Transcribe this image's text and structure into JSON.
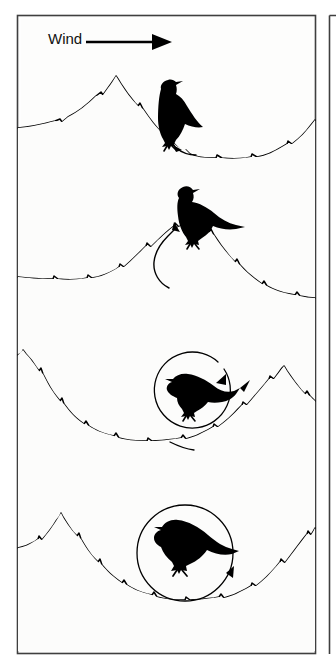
{
  "figure": {
    "name": "snow-dune-bird-sequence",
    "panel_count": 4,
    "background_color": "#fdfdfc",
    "ink_color": "#000000",
    "frame": {
      "outer_border_color": "#3b3b3b",
      "inner_border_color": "#555555",
      "x": 17,
      "y": 15,
      "width": 299,
      "height": 639
    },
    "side_frame": {
      "visible": true,
      "x": 328,
      "y": 15,
      "width": 8,
      "height": 639
    }
  },
  "annotations": {
    "wind_label": "Wind",
    "wind_arrow_direction": "right",
    "wind_arrow": {
      "x1": 86,
      "y1": 42,
      "x2": 168,
      "y2": 42
    }
  },
  "panels": [
    {
      "id": "panel-1",
      "index": 1,
      "caption": "",
      "bird": {
        "x": 175,
        "y": 115,
        "facing": "right",
        "pose": "standing-upright"
      },
      "flow_marker": {
        "type": "short-arrow",
        "direction": "up-left",
        "description": "small arrow at bird feet pointing back toward the slope"
      },
      "terrain": {
        "description": "sharp dune crest left of bird, bird on lee slope, broad trough to the right",
        "crest_x": 115,
        "trough_x": 240
      }
    },
    {
      "id": "panel-2",
      "index": 2,
      "caption": "",
      "bird": {
        "x": 192,
        "y": 212,
        "facing": "right",
        "pose": "standing-on-crest"
      },
      "flow_marker": {
        "type": "j-curve-arrow",
        "direction": "up",
        "description": "curved arrow sweeping up the lee face toward the bird"
      },
      "terrain": {
        "description": "rounded dune crest under the bird, long trough to the left",
        "crest_x": 192,
        "trough_x": 80
      }
    },
    {
      "id": "panel-3",
      "index": 3,
      "caption": "",
      "bird": {
        "x": 205,
        "y": 392,
        "facing": "left",
        "pose": "crouched-head-down"
      },
      "flow_marker": {
        "type": "circular-vortex-arrow",
        "direction": "clockwise",
        "description": "near-complete circular eddy arrow ending above and right of the bird"
      },
      "terrain": {
        "description": "wide trough between dunes, steep slope rising at the right edge",
        "trough_x": 150,
        "crest_x": 283
      }
    },
    {
      "id": "panel-4",
      "index": 4,
      "caption": "",
      "bird": {
        "x": 185,
        "y": 548,
        "facing": "left",
        "pose": "standing-in-hollow"
      },
      "flow_marker": {
        "type": "circular-vortex-arrow",
        "direction": "clockwise",
        "description": "full circular eddy arrow enclosing the bird, arrowhead at lower right"
      },
      "terrain": {
        "description": "sharp dune peak at left, deep rounded hollow holding the bird, slope rising right",
        "crest_x": 62,
        "trough_x": 185
      }
    }
  ]
}
